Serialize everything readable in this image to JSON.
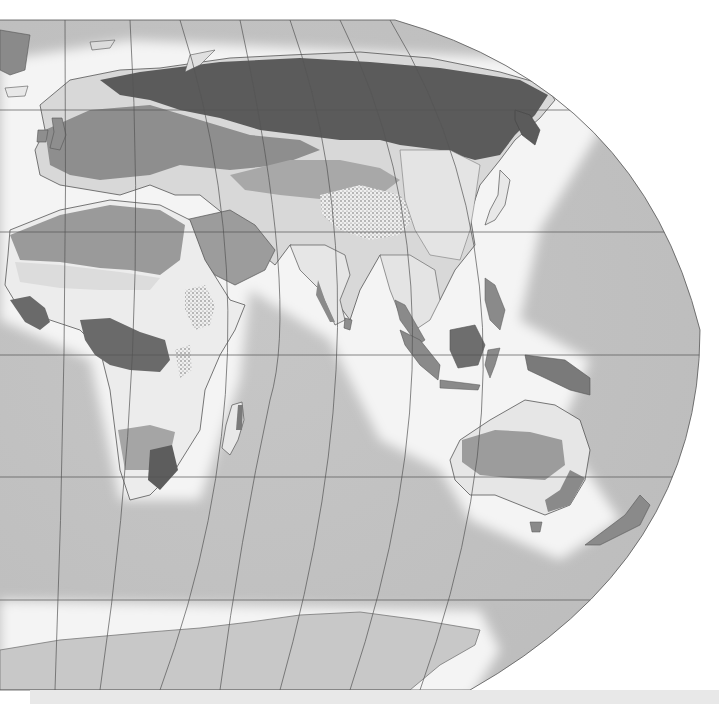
{
  "map": {
    "title": "",
    "region": "Eastern Hemisphere",
    "type": "vegetation-biome-map",
    "colors": {
      "ocean_deep": "#bdbdbd",
      "ocean_shelf": "#f2f2f2",
      "tundra": "#e6e6e6",
      "boreal_forest": "#5a5a5a",
      "temperate_forest": "#8c8c8c",
      "grassland": "#d4d4d4",
      "desert": "#9c9c9c",
      "savanna": "#ececec",
      "tropical_forest": "#6a6a6a",
      "mountain": "#dcdcdc",
      "ice": "#c4c4c4",
      "graticule": "#555555",
      "background": "#ffffff"
    },
    "features": [
      "Europe",
      "Siberia",
      "Africa",
      "Arabia",
      "India",
      "China",
      "Southeast Asia",
      "Indonesia",
      "Australia",
      "New Zealand",
      "Madagascar",
      "Japan",
      "Antarctica"
    ]
  },
  "bottom_bar": {
    "label": ""
  }
}
